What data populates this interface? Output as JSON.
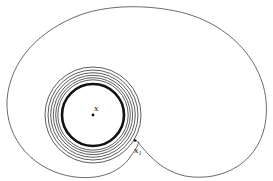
{
  "diagram": {
    "type": "phase-portrait",
    "labels": {
      "center": "x",
      "start_point": "x",
      "start_subscript": "1"
    },
    "colors": {
      "background": "#ffffff",
      "stroke": "#333333"
    }
  }
}
